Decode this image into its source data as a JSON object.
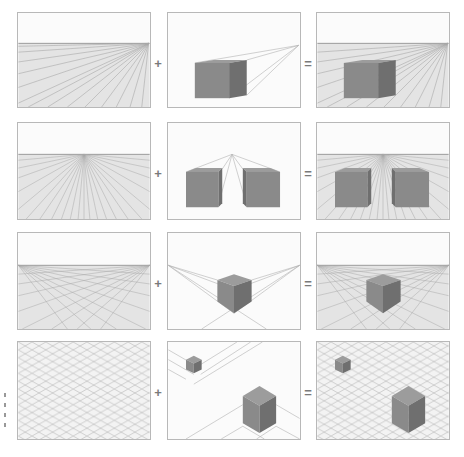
{
  "figure": {
    "rows": [
      {
        "name": "one-point-side",
        "left": "one-point perspective grid (vanishing point at right)",
        "middle": "box with lines converging to right vanishing point",
        "right": "box placed in one-point grid"
      },
      {
        "name": "one-point-center",
        "left": "one-point perspective grid (vanishing point at center)",
        "middle": "two boxes with lines converging to central vanishing point",
        "right": "two boxes placed in central one-point grid"
      },
      {
        "name": "two-point",
        "left": "two-point perspective grid",
        "middle": "cube seen from corner with two vanishing points",
        "right": "cube placed in two-point grid"
      },
      {
        "name": "isometric",
        "left": "isometric diamond grid",
        "middle": "two isometric cubes with guide lines",
        "right": "two cubes placed on isometric grid"
      }
    ],
    "operators": {
      "plus": "+",
      "equals": "="
    },
    "colors": {
      "panel_border": "#b8b8b8",
      "sky": "#fbfbfb",
      "ground": "#e4e4e4",
      "grid_line": "#a8a8a8",
      "cube_front": "#8a8a8a",
      "cube_side": "#6f6f6f",
      "cube_top": "#9c9c9c",
      "operator": "#7a7a7a"
    }
  }
}
